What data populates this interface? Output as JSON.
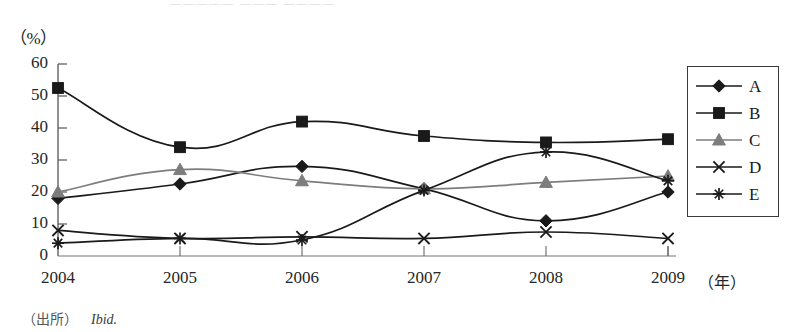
{
  "figure": {
    "top_bleed_text": "—————  ———  ————",
    "y_axis_unit": "（%）",
    "x_axis_unit": "（年）"
  },
  "source": {
    "prefix": "（出所）",
    "reference": "Ibid."
  },
  "legend": {
    "entries": [
      {
        "label": "A",
        "marker": "diamond-marker-icon",
        "color": "#1a1a1a"
      },
      {
        "label": "B",
        "marker": "square-marker-icon",
        "color": "#1a1a1a"
      },
      {
        "label": "C",
        "marker": "triangle-marker-icon",
        "color": "#7d7d7d"
      },
      {
        "label": "D",
        "marker": "cross-marker-icon",
        "color": "#1a1a1a"
      },
      {
        "label": "E",
        "marker": "asterisk-marker-icon",
        "color": "#1a1a1a"
      }
    ]
  },
  "chart_data": {
    "type": "line",
    "title": "",
    "xlabel": "（年）",
    "ylabel": "（%）",
    "categories": [
      "2004",
      "2005",
      "2006",
      "2007",
      "2008",
      "2009"
    ],
    "ylim": [
      0,
      60
    ],
    "yticks": [
      0,
      10,
      20,
      30,
      40,
      50,
      60
    ],
    "grid": false,
    "legend_position": "right",
    "series": [
      {
        "name": "A",
        "marker": "diamond",
        "color": "#1a1a1a",
        "values": [
          18,
          22.5,
          28,
          21,
          11,
          20
        ]
      },
      {
        "name": "B",
        "marker": "square",
        "color": "#1a1a1a",
        "values": [
          52.5,
          34,
          42,
          37.5,
          35.5,
          36.5
        ]
      },
      {
        "name": "C",
        "marker": "triangle",
        "color": "#7d7d7d",
        "values": [
          20,
          27,
          23.5,
          21,
          23,
          25
        ]
      },
      {
        "name": "D",
        "marker": "cross",
        "color": "#1a1a1a",
        "values": [
          8,
          5.5,
          6,
          5.5,
          7.5,
          5.5
        ]
      },
      {
        "name": "E",
        "marker": "asterisk",
        "color": "#1a1a1a",
        "values": [
          4,
          5.5,
          5,
          20.5,
          32.5,
          23.5
        ]
      }
    ]
  }
}
